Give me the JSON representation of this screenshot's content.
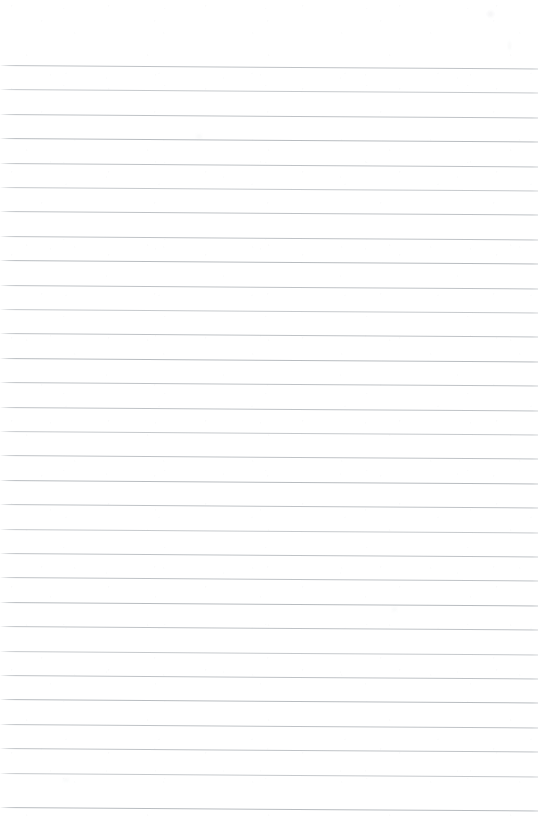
{
  "document": {
    "kind": "scanned-ruled-notebook-page",
    "title": "Blank Lined Notebook Page",
    "page_width": 542,
    "page_height": 833,
    "background_color": "#ffffff",
    "content_text": "",
    "visible_text_count": 0,
    "has_handwriting": false,
    "has_margin_rule": false,
    "orientation": "portrait"
  },
  "ruling": {
    "style": "wide-ruled horizontal lines",
    "line_color": "#b8bcc0",
    "line_thickness_px": 1,
    "line_count": 31,
    "first_line_y": 65,
    "last_line_y": 807,
    "line_spacing_px": 24.4,
    "line_start_x": 0,
    "line_end_x": 538,
    "left_fade_px": 12,
    "skew_degrees": 0.37,
    "top_margin_px": 65,
    "bottom_margin_px": 26,
    "line_ys": [
      65,
      89.4,
      113.8,
      138.2,
      162.6,
      187,
      211.4,
      235.8,
      260.2,
      284.6,
      309,
      333.4,
      357.8,
      382.2,
      406.6,
      431,
      455.4,
      479.8,
      504.2,
      528.6,
      553,
      577.4,
      601.8,
      626.2,
      650.6,
      675,
      699.4,
      723.8,
      748.2,
      772.6,
      807
    ],
    "line_weights": [
      "mid",
      "light",
      "mid",
      "dark",
      "mid",
      "light",
      "mid",
      "mid",
      "dark",
      "mid",
      "light",
      "mid",
      "dark",
      "mid",
      "mid",
      "light",
      "mid",
      "dark",
      "mid",
      "light",
      "mid",
      "mid",
      "dark",
      "mid",
      "light",
      "mid",
      "dark",
      "mid",
      "mid",
      "light",
      "dark"
    ]
  },
  "artifacts": {
    "smudges": [
      {
        "x": 487,
        "y": 11,
        "w": 7,
        "h": 6,
        "opacity": 0.1
      },
      {
        "x": 508,
        "y": 41,
        "w": 3,
        "h": 9,
        "opacity": 0.07
      },
      {
        "x": 196,
        "y": 134,
        "w": 6,
        "h": 5,
        "opacity": 0.06
      },
      {
        "x": 392,
        "y": 607,
        "w": 5,
        "h": 5,
        "opacity": 0.06
      },
      {
        "x": 63,
        "y": 778,
        "w": 6,
        "h": 4,
        "opacity": 0.06
      }
    ]
  }
}
